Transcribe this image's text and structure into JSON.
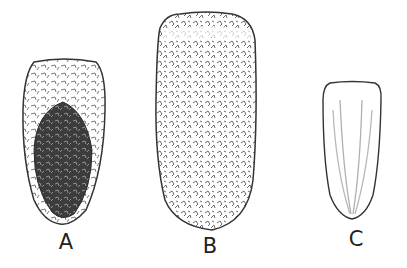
{
  "figure": {
    "panels": [
      {
        "id": "A",
        "label": "A",
        "description": "ovate seed with dark reticulate central area and lighter speckled margin"
      },
      {
        "id": "B",
        "label": "B",
        "description": "oblong seed covered uniformly with irregular reticulate markings"
      },
      {
        "id": "C",
        "label": "C",
        "description": "smooth obovate seed with faint longitudinal striations"
      }
    ],
    "colors": {
      "outline": "#333333",
      "dark_fill": "#3a3a3a",
      "marking": "#666666",
      "stripe": "#b0b0b0",
      "background": "#ffffff"
    }
  }
}
